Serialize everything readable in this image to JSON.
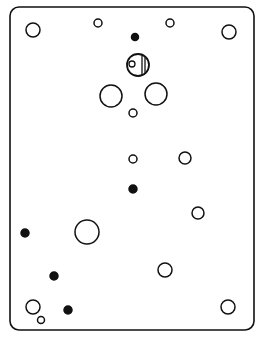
{
  "diagram": {
    "stroke_color": "#111111",
    "background": "#ffffff",
    "frame": {
      "x": 10,
      "y": 7,
      "width": 244,
      "height": 323,
      "radius": 9
    },
    "holes": [
      {
        "id": "top-left-hole",
        "cx": 33,
        "cy": 30,
        "r": 7,
        "filled": false
      },
      {
        "id": "top-small-hole-left",
        "cx": 98,
        "cy": 23,
        "r": 4,
        "filled": false
      },
      {
        "id": "top-small-hole-right",
        "cx": 170,
        "cy": 23,
        "r": 4,
        "filled": false
      },
      {
        "id": "top-right-hole",
        "cx": 229,
        "cy": 32,
        "r": 7,
        "filled": false
      },
      {
        "id": "top-center-dot",
        "cx": 135,
        "cy": 37,
        "r": 3.5,
        "filled": true
      },
      {
        "id": "left-large-hole",
        "cx": 111,
        "cy": 96,
        "r": 11,
        "filled": false
      },
      {
        "id": "right-large-hole",
        "cx": 156,
        "cy": 94,
        "r": 11,
        "filled": false
      },
      {
        "id": "center-small-hole-1",
        "cx": 133,
        "cy": 113,
        "r": 4,
        "filled": false
      },
      {
        "id": "center-small-hole-2",
        "cx": 133,
        "cy": 159,
        "r": 4,
        "filled": false
      },
      {
        "id": "right-mid-hole",
        "cx": 185,
        "cy": 158,
        "r": 6,
        "filled": false
      },
      {
        "id": "center-dot",
        "cx": 133,
        "cy": 189,
        "r": 4,
        "filled": true
      },
      {
        "id": "right-lower-hole",
        "cx": 198,
        "cy": 213,
        "r": 6,
        "filled": false
      },
      {
        "id": "left-edge-dot",
        "cx": 25,
        "cy": 233,
        "r": 4,
        "filled": true
      },
      {
        "id": "lower-large-hole",
        "cx": 87,
        "cy": 232,
        "r": 12,
        "filled": false
      },
      {
        "id": "lower-right-hole",
        "cx": 165,
        "cy": 270,
        "r": 7,
        "filled": false
      },
      {
        "id": "lower-left-dot",
        "cx": 54,
        "cy": 276,
        "r": 4,
        "filled": true
      },
      {
        "id": "bottom-left-hole",
        "cx": 33,
        "cy": 307,
        "r": 7,
        "filled": false
      },
      {
        "id": "bottom-left-small",
        "cx": 41,
        "cy": 320,
        "r": 3.5,
        "filled": false
      },
      {
        "id": "bottom-dot",
        "cx": 68,
        "cy": 310,
        "r": 4,
        "filled": true
      },
      {
        "id": "bottom-right-hole",
        "cx": 228,
        "cy": 307,
        "r": 7,
        "filled": false
      }
    ],
    "striped_hole": {
      "cx": 138,
      "cy": 65,
      "r": 11,
      "inner": {
        "cx": 132,
        "cy": 64,
        "r": 3
      },
      "stripes_x": [
        142,
        145
      ]
    }
  }
}
